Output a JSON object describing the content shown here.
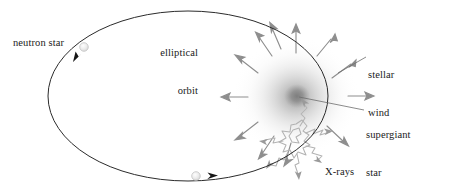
{
  "diagram": {
    "type": "astronomy-schematic",
    "width": 457,
    "height": 194,
    "background_color": "#ffffff"
  },
  "labels": {
    "neutron_star": "neutron star",
    "elliptical_orbit_line1": "elliptical",
    "elliptical_orbit_line2": "orbit",
    "stellar_wind_line1": "stellar",
    "stellar_wind_line2": "wind",
    "supergiant_star_line1": "supergiant",
    "supergiant_star_line2": "star",
    "xrays": "X-rays"
  },
  "colors": {
    "orbit_stroke": "#2b2b2b",
    "wind_arrow": "#8e8e8e",
    "xray_stroke": "#b0b0b0",
    "xray_arrow": "#9a9a9a",
    "star_core": "#8d8d8d",
    "star_halo": "#c9c9c9",
    "neutron_star_fill": "#e8e8e8",
    "neutron_star_stroke": "#c0c0c0",
    "leader_line": "#6d6d6d",
    "text": "#1a1a1a"
  },
  "orbit": {
    "center_x": 188,
    "center_y": 96,
    "radius_x": 140,
    "radius_y": 85,
    "stroke_width": 1.0,
    "direction": "clockwise"
  },
  "supergiant_star": {
    "center_x": 296,
    "center_y": 97,
    "halo_radius": 62,
    "core_radius": 11
  },
  "neutron_star_positions": [
    {
      "id": "upper-left",
      "x": 84,
      "y": 47,
      "radius": 4.2
    },
    {
      "id": "bottom",
      "x": 196,
      "y": 176,
      "radius": 4.2
    }
  ],
  "motion_arrows": [
    {
      "id": "upper-left-motion",
      "x": 78,
      "y": 56,
      "angle_deg": 115
    },
    {
      "id": "bottom-motion",
      "x": 212,
      "y": 175,
      "angle_deg": -12
    }
  ],
  "wind_arrows": [
    {
      "id": "wind-n",
      "angle_deg": -90,
      "start_r": 44,
      "length": 26
    },
    {
      "id": "wind-nne",
      "angle_deg": -64,
      "start_r": 46,
      "length": 24
    },
    {
      "id": "wind-nnw",
      "angle_deg": -115,
      "start_r": 44,
      "length": 24
    },
    {
      "id": "wind-ne",
      "angle_deg": -38,
      "start_r": 48,
      "length": 25
    },
    {
      "id": "wind-nw",
      "angle_deg": -143,
      "start_r": 46,
      "length": 24
    },
    {
      "id": "wind-w",
      "angle_deg": 180,
      "start_r": 52,
      "length": 27
    },
    {
      "id": "wind-e",
      "angle_deg": 0,
      "start_r": 52,
      "length": 24
    },
    {
      "id": "wind-sw",
      "angle_deg": 143,
      "start_r": 46,
      "length": 25
    },
    {
      "id": "wind-ssw",
      "angle_deg": 118,
      "start_r": 48,
      "length": 24
    },
    {
      "id": "wind-s",
      "angle_deg": 97,
      "start_r": 50,
      "length": 22
    }
  ],
  "xray_source": {
    "x": 300,
    "y": 140,
    "ray_count": 6,
    "description": "jagged X-ray emission at accretion point"
  },
  "leader_lines": [
    {
      "id": "stellar-wind-leader",
      "x1": 366,
      "y1": 56,
      "x2": 338,
      "y2": 72
    },
    {
      "id": "supergiant-leader",
      "x1": 364,
      "y1": 110,
      "x2": 299,
      "y2": 98
    },
    {
      "id": "neutron-star-leader",
      "x1": 78,
      "y1": 44,
      "x2": 84,
      "y2": 47
    }
  ]
}
